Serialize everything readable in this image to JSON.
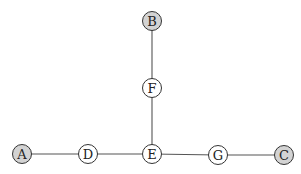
{
  "diagram": {
    "type": "tree-graph",
    "colors": {
      "terminal_fill": "#d3d3d3",
      "internal_fill": "#ffffff",
      "edge": "#555555"
    },
    "nodes": [
      {
        "id": "A",
        "label": "A",
        "x": 22,
        "y": 154,
        "terminal": true
      },
      {
        "id": "B",
        "label": "B",
        "x": 152,
        "y": 21,
        "terminal": true
      },
      {
        "id": "C",
        "label": "C",
        "x": 284,
        "y": 155,
        "terminal": true
      },
      {
        "id": "D",
        "label": "D",
        "x": 88,
        "y": 154,
        "terminal": false
      },
      {
        "id": "E",
        "label": "E",
        "x": 152,
        "y": 154,
        "terminal": false
      },
      {
        "id": "F",
        "label": "F",
        "x": 152,
        "y": 88,
        "terminal": false
      },
      {
        "id": "G",
        "label": "G",
        "x": 218,
        "y": 155,
        "terminal": false
      }
    ],
    "edges": [
      [
        "A",
        "D"
      ],
      [
        "D",
        "E"
      ],
      [
        "E",
        "G"
      ],
      [
        "G",
        "C"
      ],
      [
        "E",
        "F"
      ],
      [
        "F",
        "B"
      ]
    ]
  }
}
